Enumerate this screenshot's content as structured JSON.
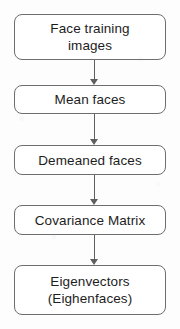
{
  "diagram": {
    "orientation": "vertical-top-to-bottom",
    "background_color": "#fdfdfd",
    "box_border_color": "#6e6e6e",
    "box_fill_color": "#ffffff",
    "text_color": "#1d1d1d",
    "arrow_color": "#5f5f5f",
    "nodes": [
      {
        "id": "face-training-images",
        "label": "Face training\nimages",
        "shape": "rounded-rectangle",
        "lines": 2
      },
      {
        "id": "mean-faces",
        "label": "Mean faces",
        "shape": "rounded-rectangle",
        "lines": 1
      },
      {
        "id": "demeaned-faces",
        "label": "Demeaned faces",
        "shape": "rounded-rectangle",
        "lines": 1
      },
      {
        "id": "covariance-matrix",
        "label": "Covariance Matrix",
        "shape": "rounded-rectangle",
        "lines": 1
      },
      {
        "id": "eigenvectors",
        "label": "Eigenvectors\n(Eighenfaces)",
        "shape": "rounded-rectangle",
        "lines": 2
      }
    ],
    "connectors": [
      {
        "id": "arrow-1",
        "from": "face-training-images",
        "to": "mean-faces",
        "icon": "arrow-down-icon"
      },
      {
        "id": "arrow-2",
        "from": "mean-faces",
        "to": "demeaned-faces",
        "icon": "arrow-down-icon"
      },
      {
        "id": "arrow-3",
        "from": "demeaned-faces",
        "to": "covariance-matrix",
        "icon": "arrow-down-icon"
      },
      {
        "id": "arrow-4",
        "from": "covariance-matrix",
        "to": "eigenvectors",
        "icon": "arrow-down-icon"
      }
    ]
  }
}
